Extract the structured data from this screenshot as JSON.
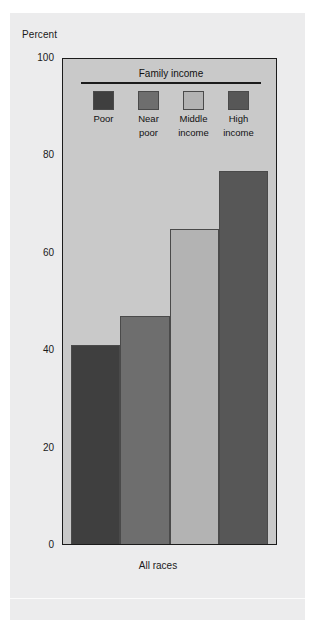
{
  "axis": {
    "y_axis_title": "Percent",
    "y_ticks": [
      "100",
      "80",
      "60",
      "40",
      "20",
      "0"
    ],
    "x_axis_label": "All races"
  },
  "legend": {
    "title": "Family income",
    "items": [
      {
        "label_line1": "Poor",
        "label_line2": "",
        "color": "#3f3f3f"
      },
      {
        "label_line1": "Near",
        "label_line2": "poor",
        "color": "#6e6e6e"
      },
      {
        "label_line1": "Middle",
        "label_line2": "income",
        "color": "#b3b3b3"
      },
      {
        "label_line1": "High",
        "label_line2": "income",
        "color": "#575757"
      }
    ]
  },
  "chart_data": {
    "type": "bar",
    "title": "",
    "xlabel": "All races",
    "ylabel": "Percent",
    "ylim": [
      0,
      100
    ],
    "yticks": [
      0,
      20,
      40,
      60,
      80,
      100
    ],
    "grid": false,
    "legend_title": "Family income",
    "legend_position": "inside-top",
    "categories": [
      "Poor",
      "Near poor",
      "Middle income",
      "High income"
    ],
    "values": [
      41,
      47,
      65,
      77
    ],
    "colors": [
      "#3f3f3f",
      "#6e6e6e",
      "#b3b3b3",
      "#575757"
    ],
    "group": "All races"
  },
  "colors": {
    "plot_background": "#c9c9c9",
    "card_background": "#ececed",
    "axis_line": "#1b1b1b",
    "text": "#1a1a1a"
  }
}
